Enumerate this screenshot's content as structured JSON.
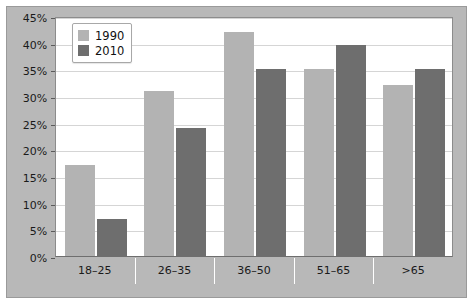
{
  "chart_data": {
    "type": "bar",
    "title": "",
    "subtitle": "",
    "xlabel": "",
    "ylabel": "",
    "categories": [
      "18–25",
      "26–35",
      "36–50",
      "51–65",
      ">65"
    ],
    "series": [
      {
        "name": "1990",
        "color": "#b3b3b3",
        "values": [
          17,
          31,
          42,
          35,
          32
        ]
      },
      {
        "name": "2010",
        "color": "#6e6e6e",
        "values": [
          7,
          24,
          35,
          39.5,
          35
        ]
      }
    ],
    "ylim": [
      0,
      45
    ],
    "ytick_step": 5,
    "ytick_labels": [
      "0%",
      "5%",
      "10%",
      "15%",
      "20%",
      "25%",
      "30%",
      "35%",
      "40%",
      "45%"
    ],
    "ytick_values": [
      0,
      5,
      10,
      15,
      20,
      25,
      30,
      35,
      40,
      45
    ],
    "grid": true,
    "grid_axis": "y",
    "legend_position": "top-left",
    "value_suffix": "%",
    "plot_background": "#ffffff",
    "panel_background": "#b8b8b8",
    "gridline_color": "#d5d5d5",
    "axis_color": "#8c8c8c"
  }
}
